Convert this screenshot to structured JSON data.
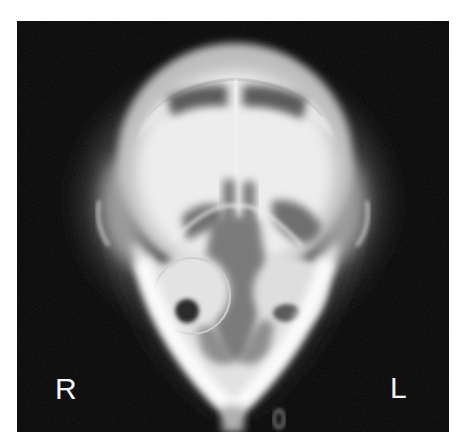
{
  "image": {
    "description": "Radiograph of a skull (ventrodorsal/frontal view) on black background",
    "background_color": "#050505",
    "page_color": "#ffffff"
  },
  "labels": {
    "right": "R",
    "left": "L"
  }
}
